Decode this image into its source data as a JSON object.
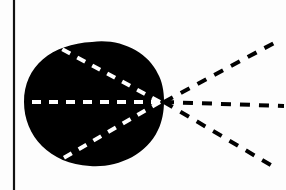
{
  "diagram": {
    "colors": {
      "background": "#fdfdfd",
      "shape_fill": "#000000",
      "inner_dash": "#ffffff",
      "outer_dash": "#000000",
      "axis_line": "#111111"
    },
    "vertical_line": {
      "x": 14,
      "y1": 0,
      "y2": 190
    },
    "focal_point": {
      "x": 160,
      "y": 102
    },
    "inner_rays": [
      {
        "x": 58,
        "y": 47
      },
      {
        "x": 25,
        "y": 102
      },
      {
        "x": 60,
        "y": 160
      }
    ],
    "outer_rays": [
      {
        "x": 274,
        "y": 43
      },
      {
        "x": 284,
        "y": 106
      },
      {
        "x": 274,
        "y": 167
      }
    ]
  }
}
